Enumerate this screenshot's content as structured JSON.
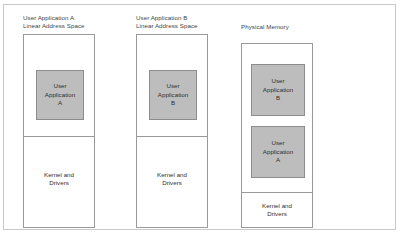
{
  "figure": {
    "columns": [
      {
        "id": "user-application-a-space",
        "label": "User Application A\nLinear Address Space",
        "blocks": [
          {
            "id": "app-a",
            "label": "User\nApplication\nA"
          }
        ],
        "kernel_label": "Kernel and\nDrivers"
      },
      {
        "id": "user-application-b-space",
        "label": "User Application B\nLinear Address Space",
        "blocks": [
          {
            "id": "app-b",
            "label": "User\nApplication\nB"
          }
        ],
        "kernel_label": "Kernel and\nDrivers"
      },
      {
        "id": "physical-memory",
        "label": "Physical Memory",
        "blocks": [
          {
            "id": "app-b",
            "label": "User\nApplication\nB"
          },
          {
            "id": "app-a",
            "label": "User\nApplication\nA"
          }
        ],
        "kernel_label": "Kernel and\nDrivers"
      }
    ]
  },
  "colors": {
    "page_background": "#ffffff",
    "frame_border": "#c9c9c9",
    "box_border": "#9a9a9a",
    "block_fill": "#bdbdbd",
    "block_border": "#8d8d8d",
    "text": "#2f2f2f"
  }
}
